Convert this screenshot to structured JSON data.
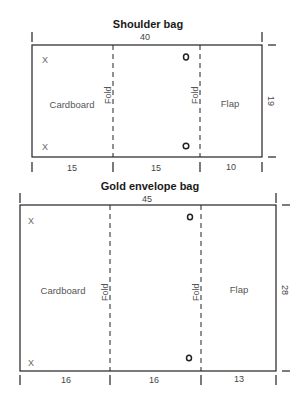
{
  "diagrams": [
    {
      "title": "Shoulder bag",
      "width_label": "40",
      "height_label": "19",
      "segments": [
        "15",
        "15",
        "10"
      ],
      "panels": {
        "left": "Cardboard",
        "right": "Flap"
      },
      "fold_label": "Fold",
      "corner_mark": "X",
      "geometry": {
        "x0": 32,
        "x1": 113,
        "x2": 200,
        "x3": 262,
        "top": 45,
        "bottom": 157,
        "hole_x": 185,
        "hole_y1": 57,
        "hole_y2": 146
      }
    },
    {
      "title": "Gold envelope bag",
      "width_label": "45",
      "height_label": "28",
      "segments": [
        "16",
        "16",
        "13"
      ],
      "panels": {
        "left": "Cardboard",
        "right": "Flap"
      },
      "fold_label": "Fold",
      "corner_mark": "X",
      "geometry": {
        "x0": 20,
        "x1": 110,
        "x2": 201,
        "x3": 276,
        "top": 205,
        "bottom": 371,
        "hole_x": 189,
        "hole_y1": 217,
        "hole_y2": 358
      }
    }
  ],
  "colors": {
    "line": "#222222",
    "text": "#555555",
    "background": "#ffffff"
  }
}
